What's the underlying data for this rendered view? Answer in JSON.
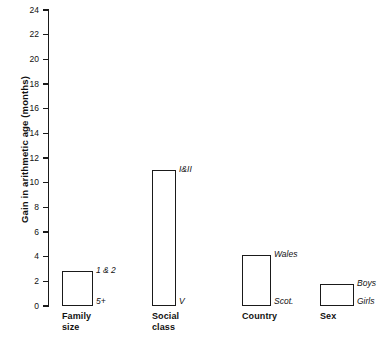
{
  "chart_data": {
    "type": "bar",
    "title": "",
    "subtitle": "",
    "xlabel": "",
    "ylabel": "Gain in arithmetic age (months)",
    "ylim": [
      0,
      24
    ],
    "ytick_step": 2,
    "yticks": [
      "24",
      "22",
      "20",
      "18",
      "16",
      "14",
      "12",
      "10",
      "8",
      "6",
      "4",
      "2",
      "0"
    ],
    "grid": false,
    "legend": "none",
    "note": "Each bar is an open rectangle spanning from 0 to the value; the top edge is annotated with the higher-scoring group and the bottom edge with the lower-scoring group.",
    "categories": [
      "Family size",
      "Social class",
      "Country",
      "Sex"
    ],
    "values": [
      2.8,
      11.0,
      4.1,
      1.8
    ],
    "series": [
      {
        "name": "Gain in arithmetic age (months)",
        "values": [
          2.8,
          11.0,
          4.1,
          1.8
        ]
      }
    ],
    "bars": [
      {
        "category": "Family size",
        "category_line1": "Family",
        "category_line2": "size",
        "value": 2.8,
        "top_label": "1 & 2",
        "bottom_label": "5+"
      },
      {
        "category": "Social class",
        "category_line1": "Social",
        "category_line2": "class",
        "value": 11.0,
        "top_label": "I&II",
        "bottom_label": "V"
      },
      {
        "category": "Country",
        "category_line1": "Country",
        "category_line2": "",
        "value": 4.1,
        "top_label": "Wales",
        "bottom_label": "Scot."
      },
      {
        "category": "Sex",
        "category_line1": "Sex",
        "category_line2": "",
        "value": 1.8,
        "top_label": "Boys",
        "bottom_label": "Girls"
      }
    ],
    "colors": {
      "bar_outline": "#1a1a1a",
      "bar_fill": "#ffffff",
      "axis": "#1a1a1a",
      "text": "#111111",
      "background": "#ffffff"
    }
  }
}
